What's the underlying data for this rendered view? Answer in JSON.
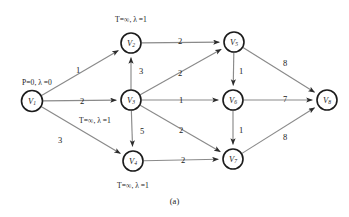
{
  "figure": {
    "caption": "(a)",
    "caption_y": 196,
    "width": 349,
    "height": 217,
    "background": "#ffffff",
    "node_stroke": "#1b1b1b",
    "edge_stroke": "#8a8a8a",
    "text_color": "#1a1a1a"
  },
  "chart_data": {
    "type": "diagram",
    "diagram_kind": "weighted directed graph",
    "title": "(a)",
    "nodes": [
      {
        "id": "V1",
        "name": "V",
        "sub": "1",
        "x": 32,
        "y": 101,
        "r": 10.5
      },
      {
        "id": "V2",
        "name": "V",
        "sub": "2",
        "x": 131,
        "y": 43,
        "r": 10.0
      },
      {
        "id": "V3",
        "name": "V",
        "sub": "3",
        "x": 131,
        "y": 100,
        "r": 10.0
      },
      {
        "id": "V4",
        "name": "V",
        "sub": "4",
        "x": 133,
        "y": 161,
        "r": 10.0
      },
      {
        "id": "V5",
        "name": "V",
        "sub": "5",
        "x": 234,
        "y": 42,
        "r": 10.0
      },
      {
        "id": "V6",
        "name": "V",
        "sub": "6",
        "x": 233,
        "y": 100,
        "r": 10.0
      },
      {
        "id": "V7",
        "name": "V",
        "sub": "7",
        "x": 233,
        "y": 159,
        "r": 10.0
      },
      {
        "id": "V8",
        "name": "V",
        "sub": "8",
        "x": 327,
        "y": 100,
        "r": 10.0
      }
    ],
    "edges": [
      {
        "from": "V1",
        "to": "V2",
        "weight": "1",
        "label_x": 78,
        "label_y": 70
      },
      {
        "from": "V1",
        "to": "V3",
        "weight": "2",
        "label_x": 82,
        "label_y": 101
      },
      {
        "from": "V1",
        "to": "V4",
        "weight": "3",
        "label_x": 60,
        "label_y": 140
      },
      {
        "from": "V3",
        "to": "V2",
        "weight": "3",
        "label_x": 141,
        "label_y": 71
      },
      {
        "from": "V2",
        "to": "V5",
        "weight": "2",
        "label_x": 180,
        "label_y": 41
      },
      {
        "from": "V3",
        "to": "V5",
        "weight": "2",
        "label_x": 180,
        "label_y": 73
      },
      {
        "from": "V3",
        "to": "V6",
        "weight": "1",
        "label_x": 181,
        "label_y": 100
      },
      {
        "from": "V3",
        "to": "V4",
        "weight": "5",
        "label_x": 142,
        "label_y": 131
      },
      {
        "from": "V3",
        "to": "V7",
        "weight": "2",
        "label_x": 181,
        "label_y": 130
      },
      {
        "from": "V4",
        "to": "V7",
        "weight": "2",
        "label_x": 183,
        "label_y": 160
      },
      {
        "from": "V5",
        "to": "V6",
        "weight": "1",
        "label_x": 241,
        "label_y": 71
      },
      {
        "from": "V5",
        "to": "V8",
        "weight": "8",
        "label_x": 285,
        "label_y": 63
      },
      {
        "from": "V6",
        "to": "V7",
        "weight": "1",
        "label_x": 241,
        "label_y": 130
      },
      {
        "from": "V6",
        "to": "V8",
        "weight": "7",
        "label_x": 285,
        "label_y": 99
      },
      {
        "from": "V7",
        "to": "V8",
        "weight": "8",
        "label_x": 285,
        "label_y": 137
      }
    ],
    "state_labels": [
      {
        "node": "V1",
        "text": "P=0, λ =0",
        "x": 37,
        "y": 83
      },
      {
        "node": "V2",
        "text": "T=∞, λ =1",
        "x": 131,
        "y": 20
      },
      {
        "node": "V3",
        "text": "T=∞, λ =1",
        "x": 95,
        "y": 121
      },
      {
        "node": "V4",
        "text": "T=∞, λ =1",
        "x": 133,
        "y": 186
      }
    ]
  }
}
